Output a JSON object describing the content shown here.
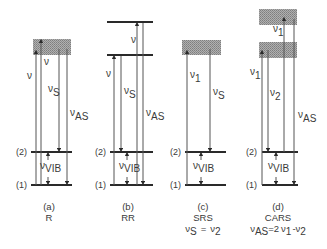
{
  "figure": {
    "colors": {
      "line": "#2a2a2a",
      "arrow": "#555555",
      "virtual_state_fill": "#9a9a9a",
      "text": "#3a3a3a"
    },
    "level_labels": {
      "upper": "(2)",
      "lower": "(1)"
    },
    "symbols": {
      "nu": "ν"
    },
    "panels": [
      {
        "id": "a",
        "letter": "(a)",
        "name": "R",
        "formula": "",
        "labels": {
          "excite1": "ν",
          "excite2": "ν",
          "stokes_sub": "S",
          "antistokes_sub": "AS",
          "vib_sub": "VIB"
        }
      },
      {
        "id": "b",
        "letter": "(b)",
        "name": "RR",
        "formula": "",
        "labels": {
          "excite1": "ν",
          "excite2": "ν",
          "stokes_sub": "S",
          "antistokes_sub": "AS",
          "vib_sub": "VIB"
        }
      },
      {
        "id": "c",
        "letter": "(c)",
        "name": "SRS",
        "formula_parts": {
          "lhs_sub": "S",
          "eq": "=",
          "rhs_sub": "2"
        },
        "labels": {
          "excite1_sub": "1",
          "stokes_sub": "S",
          "vib_sub": "VIB"
        }
      },
      {
        "id": "d",
        "letter": "(d)",
        "name": "CARS",
        "formula_parts": {
          "lhs_sub": "AS",
          "eq": "=2",
          "mid_sub": "1",
          "minus": "-",
          "rhs_sub": "2"
        },
        "labels": {
          "excite_top_sub": "1",
          "excite1_sub": "1",
          "excite2_sub": "2",
          "antistokes_sub": "AS",
          "vib_sub": "VIB"
        }
      }
    ]
  }
}
